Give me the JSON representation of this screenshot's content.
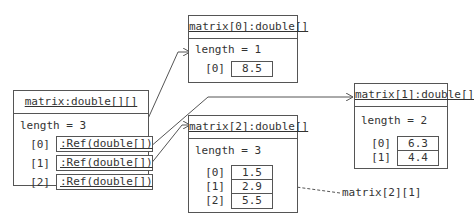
{
  "objects": {
    "matrix": {
      "title": "matrix:double[][]",
      "length": "length = 3",
      "items": [
        {
          "index": "[0]",
          "value": ":Ref(double[])"
        },
        {
          "index": "[1]",
          "value": ":Ref(double[])"
        },
        {
          "index": "[2]",
          "value": ":Ref(double[])"
        }
      ]
    },
    "m0": {
      "title": "matrix[0]:double[]",
      "length": "length = 1",
      "items": [
        {
          "index": "[0]",
          "value": "8.5"
        }
      ]
    },
    "m1": {
      "title": "matrix[1]:double[]",
      "length": "length = 2",
      "items": [
        {
          "index": "[0]",
          "value": "6.3"
        },
        {
          "index": "[1]",
          "value": "4.4"
        }
      ]
    },
    "m2": {
      "title": "matrix[2]:double[]",
      "length": "length = 3",
      "items": [
        {
          "index": "[0]",
          "value": "1.5"
        },
        {
          "index": "[1]",
          "value": "2.9"
        },
        {
          "index": "[2]",
          "value": "5.5"
        }
      ]
    }
  },
  "annotation": {
    "label": "matrix[2][1]"
  }
}
